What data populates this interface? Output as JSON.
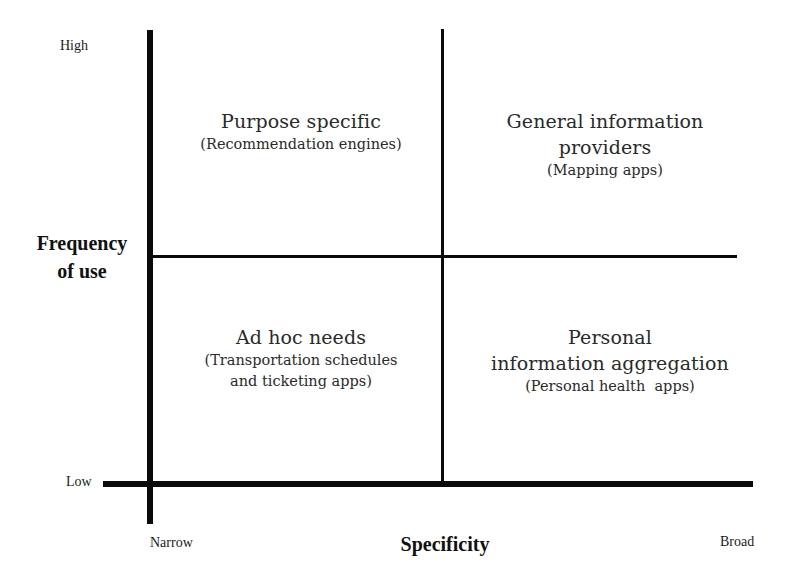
{
  "diagram": {
    "type": "2x2 quadrant matrix",
    "y_axis": {
      "title_line1": "Frequency",
      "title_line2": "of use",
      "high_label": "High",
      "low_label": "Low"
    },
    "x_axis": {
      "title": "Specificity",
      "left_label": "Narrow",
      "right_label": "Broad"
    },
    "quadrants": {
      "top_left": {
        "title": "Purpose specific",
        "example": "(Recommendation engines)"
      },
      "top_right": {
        "title_line1": "General information",
        "title_line2": "providers",
        "example": "(Mapping apps)"
      },
      "bottom_left": {
        "title": "Ad hoc needs",
        "example_line1": "(Transportation schedules",
        "example_line2": "and ticketing apps)"
      },
      "bottom_right": {
        "title_line1": "Personal",
        "title_line2": "information aggregation",
        "example": "(Personal health  apps)"
      }
    },
    "colors": {
      "lines": "#0a0a0a",
      "text": "#1a1a1a",
      "background": "#ffffff"
    }
  }
}
